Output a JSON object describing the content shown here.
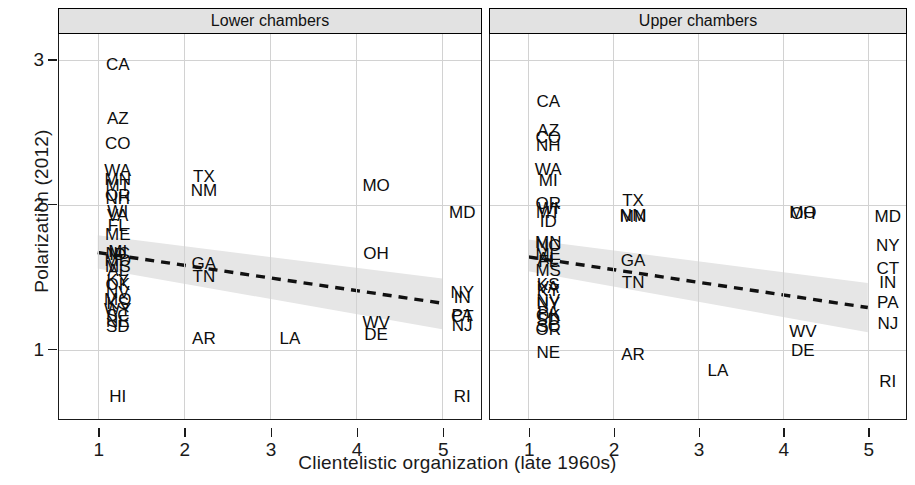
{
  "chart_data": {
    "type": "scatter",
    "title": "",
    "xlabel": "Clientelistic organization (late 1960s)",
    "ylabel": "Polarization (2012)",
    "xlim": [
      0.55,
      5.45
    ],
    "ylim": [
      0.52,
      3.18
    ],
    "xticks": [
      1,
      2,
      3,
      4,
      5
    ],
    "yticks": [
      1,
      2,
      3
    ],
    "grid": true,
    "legend": null,
    "marker_style": "state-abbreviation-text",
    "facets": [
      {
        "label": "Lower chambers",
        "points": [
          {
            "label": "CA",
            "x": 1,
            "y": 2.97
          },
          {
            "label": "AZ",
            "x": 1,
            "y": 2.6
          },
          {
            "label": "CO",
            "x": 1,
            "y": 2.43
          },
          {
            "label": "WA",
            "x": 1,
            "y": 2.24
          },
          {
            "label": "MN",
            "x": 1,
            "y": 2.18
          },
          {
            "label": "MT",
            "x": 1,
            "y": 2.14
          },
          {
            "label": "OR",
            "x": 1,
            "y": 2.07
          },
          {
            "label": "NH",
            "x": 1,
            "y": 2.05
          },
          {
            "label": "WI",
            "x": 1,
            "y": 1.96
          },
          {
            "label": "VA",
            "x": 1,
            "y": 1.93
          },
          {
            "label": "FL",
            "x": 1,
            "y": 1.86
          },
          {
            "label": "ME",
            "x": 1,
            "y": 1.8
          },
          {
            "label": "MI",
            "x": 1,
            "y": 1.68
          },
          {
            "label": "NC",
            "x": 1,
            "y": 1.67
          },
          {
            "label": "ID",
            "x": 1,
            "y": 1.66
          },
          {
            "label": "MD",
            "x": 1,
            "y": 1.62
          },
          {
            "label": "MS",
            "x": 1,
            "y": 1.58
          },
          {
            "label": "AL",
            "x": 1,
            "y": 1.55
          },
          {
            "label": "KY",
            "x": 1,
            "y": 1.48
          },
          {
            "label": "OK",
            "x": 1,
            "y": 1.45
          },
          {
            "label": "NV",
            "x": 1,
            "y": 1.4
          },
          {
            "label": "MO",
            "x": 1,
            "y": 1.35
          },
          {
            "label": "KS",
            "x": 1,
            "y": 1.32
          },
          {
            "label": "WY",
            "x": 1,
            "y": 1.28
          },
          {
            "label": "SC",
            "x": 1,
            "y": 1.24
          },
          {
            "label": "NE",
            "x": 1,
            "y": 1.2
          },
          {
            "label": "SD",
            "x": 1,
            "y": 1.16
          },
          {
            "label": "HI",
            "x": 1,
            "y": 0.68
          },
          {
            "label": "TX",
            "x": 2,
            "y": 2.2
          },
          {
            "label": "NM",
            "x": 2,
            "y": 2.1
          },
          {
            "label": "GA",
            "x": 2,
            "y": 1.6
          },
          {
            "label": "TN",
            "x": 2,
            "y": 1.51
          },
          {
            "label": "AR",
            "x": 2,
            "y": 1.08
          },
          {
            "label": "LA",
            "x": 3,
            "y": 1.08
          },
          {
            "label": "MO",
            "x": 4,
            "y": 2.14
          },
          {
            "label": "OH",
            "x": 4,
            "y": 1.67
          },
          {
            "label": "WV",
            "x": 4,
            "y": 1.19
          },
          {
            "label": "DE",
            "x": 4,
            "y": 1.11
          },
          {
            "label": "MD",
            "x": 5,
            "y": 1.95
          },
          {
            "label": "NY",
            "x": 5,
            "y": 1.4
          },
          {
            "label": "IN",
            "x": 5,
            "y": 1.36
          },
          {
            "label": "PA",
            "x": 5,
            "y": 1.24
          },
          {
            "label": "CT",
            "x": 5,
            "y": 1.23
          },
          {
            "label": "NJ",
            "x": 5,
            "y": 1.17
          },
          {
            "label": "RI",
            "x": 5,
            "y": 0.68
          }
        ],
        "fit": {
          "x1": 1,
          "y1": 1.67,
          "x2": 5,
          "y2": 1.32
        },
        "band": {
          "x1": 1,
          "lo1": 1.56,
          "hi1": 1.79,
          "x2": 5,
          "lo2": 1.14,
          "hi2": 1.49
        }
      },
      {
        "label": "Upper chambers",
        "points": [
          {
            "label": "CA",
            "x": 1,
            "y": 2.72
          },
          {
            "label": "AZ",
            "x": 1,
            "y": 2.52
          },
          {
            "label": "CO",
            "x": 1,
            "y": 2.47
          },
          {
            "label": "NH",
            "x": 1,
            "y": 2.41
          },
          {
            "label": "WA",
            "x": 1,
            "y": 2.25
          },
          {
            "label": "MI",
            "x": 1,
            "y": 2.17
          },
          {
            "label": "OR",
            "x": 1,
            "y": 2.01
          },
          {
            "label": "WI",
            "x": 1,
            "y": 1.98
          },
          {
            "label": "MT",
            "x": 1,
            "y": 1.95
          },
          {
            "label": "ID",
            "x": 1,
            "y": 1.89
          },
          {
            "label": "MN",
            "x": 1,
            "y": 1.74
          },
          {
            "label": "NC",
            "x": 1,
            "y": 1.72
          },
          {
            "label": "ME",
            "x": 1,
            "y": 1.66
          },
          {
            "label": "AL",
            "x": 1,
            "y": 1.63
          },
          {
            "label": "FL",
            "x": 1,
            "y": 1.61
          },
          {
            "label": "MS",
            "x": 1,
            "y": 1.55
          },
          {
            "label": "KS",
            "x": 1,
            "y": 1.45
          },
          {
            "label": "VA",
            "x": 1,
            "y": 1.43
          },
          {
            "label": "KY",
            "x": 1,
            "y": 1.41
          },
          {
            "label": "NV",
            "x": 1,
            "y": 1.34
          },
          {
            "label": "NY",
            "x": 1,
            "y": 1.32
          },
          {
            "label": "PA",
            "x": 1,
            "y": 1.26
          },
          {
            "label": "OK",
            "x": 1,
            "y": 1.24
          },
          {
            "label": "SD",
            "x": 1,
            "y": 1.21
          },
          {
            "label": "SC",
            "x": 1,
            "y": 1.16
          },
          {
            "label": "OR",
            "x": 1,
            "y": 1.14
          },
          {
            "label": "NE",
            "x": 1,
            "y": 0.98
          },
          {
            "label": "TX",
            "x": 2,
            "y": 2.03
          },
          {
            "label": "NM",
            "x": 2,
            "y": 1.93
          },
          {
            "label": "MN",
            "x": 2,
            "y": 1.92
          },
          {
            "label": "GA",
            "x": 2,
            "y": 1.62
          },
          {
            "label": "TN",
            "x": 2,
            "y": 1.47
          },
          {
            "label": "AR",
            "x": 2,
            "y": 0.97
          },
          {
            "label": "LA",
            "x": 3,
            "y": 0.86
          },
          {
            "label": "MO",
            "x": 4,
            "y": 1.95
          },
          {
            "label": "OH",
            "x": 4,
            "y": 1.94
          },
          {
            "label": "WV",
            "x": 4,
            "y": 1.13
          },
          {
            "label": "DE",
            "x": 4,
            "y": 1.0
          },
          {
            "label": "MD",
            "x": 5,
            "y": 1.92
          },
          {
            "label": "NY",
            "x": 5,
            "y": 1.72
          },
          {
            "label": "CT",
            "x": 5,
            "y": 1.56
          },
          {
            "label": "IN",
            "x": 5,
            "y": 1.47
          },
          {
            "label": "PA",
            "x": 5,
            "y": 1.33
          },
          {
            "label": "NJ",
            "x": 5,
            "y": 1.18
          },
          {
            "label": "RI",
            "x": 5,
            "y": 0.78
          }
        ],
        "fit": {
          "x1": 1,
          "y1": 1.64,
          "x2": 5,
          "y2": 1.29
        },
        "band": {
          "x1": 1,
          "lo1": 1.54,
          "hi1": 1.76,
          "x2": 5,
          "lo2": 1.12,
          "hi2": 1.46
        }
      }
    ],
    "colors": {
      "background": "#ffffff",
      "strip_fill": "#e2e2e2",
      "border": "#1a1a1a",
      "grid": "#d2d2d2",
      "fit_line": "#111111",
      "confidence_band": "#e6e6e6",
      "text": "#0d0d0d"
    }
  }
}
